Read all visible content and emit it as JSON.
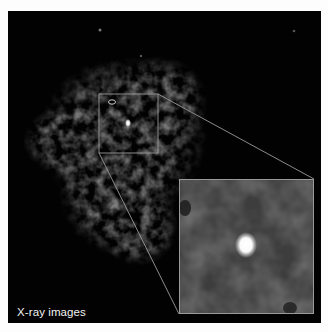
{
  "figure": {
    "label": "X-ray images",
    "colors": {
      "background": "#020202",
      "nebula": "#4a4a4a",
      "source": "#ffffff",
      "box_outline": "#9a9a9a",
      "page": "#fdfdfd"
    },
    "zoom_box": {
      "x": 99,
      "y": 94,
      "width": 59,
      "height": 59
    },
    "inset": {
      "x": 179,
      "y": 179,
      "width": 135,
      "height": 135
    },
    "point_source": {
      "x": 128,
      "y": 123
    },
    "marked_source": {
      "x": 114,
      "y": 102,
      "shape": "ellipse"
    }
  }
}
